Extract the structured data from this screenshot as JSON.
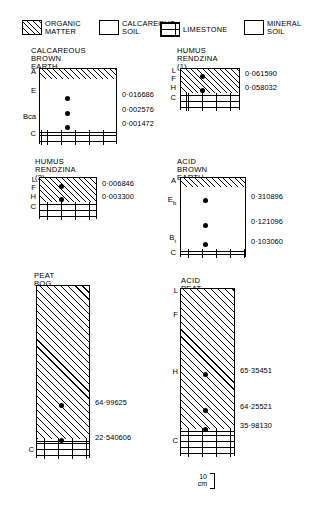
{
  "legend": {
    "items": [
      {
        "label": "ORGANIC\nMATTER",
        "pattern": "organic-matter-swatch"
      },
      {
        "label": "CALCAREOUS\nSOIL",
        "pattern": "calcareous-soil-swatch"
      },
      {
        "label": "LIMESTONE",
        "pattern": "limestone-swatch"
      },
      {
        "label": "MINERAL\nSOIL",
        "pattern": "mineral-soil-swatch"
      }
    ]
  },
  "profiles": [
    {
      "id": "calcareous-brown-earth",
      "title": "CALCAREOUS\nBROWN EARTH",
      "horizons": [
        "A",
        "E",
        "Bca",
        "C"
      ],
      "values": [
        "0·016686",
        "0·002576",
        "0·001472"
      ]
    },
    {
      "id": "humus-rendzina-1",
      "title": "HUMUS\nRENDZINA (1)",
      "horizons": [
        "L",
        "F",
        "H",
        "C"
      ],
      "values": [
        "0·061590",
        "0·058032"
      ]
    },
    {
      "id": "humus-rendzina-2",
      "title": "HUMUS\nRENDZINA (2)",
      "horizons": [
        "L",
        "F",
        "H",
        "C"
      ],
      "values": [
        "0·006846",
        "0·003300"
      ]
    },
    {
      "id": "acid-brown-earth",
      "title": "ACID BROWN\nEARTH",
      "horizons": [
        "A",
        "Eb",
        "Bt",
        "C"
      ],
      "values": [
        "0·310896",
        "0·121096",
        "0·103060"
      ]
    },
    {
      "id": "peat-bog",
      "title": "PEAT BOG",
      "horizons": [
        "C"
      ],
      "values": [
        "64·99625",
        "22·540606"
      ]
    },
    {
      "id": "acid-peat-soil",
      "title": "ACID PEAT SOIL",
      "horizons": [
        "L",
        "F",
        "H",
        "C"
      ],
      "values": [
        "65·35451",
        "64·25521",
        "35·98130"
      ]
    }
  ],
  "scale": {
    "label": "10\ncm"
  },
  "colors": {
    "ink": "#000000",
    "paper": "#ffffff"
  }
}
